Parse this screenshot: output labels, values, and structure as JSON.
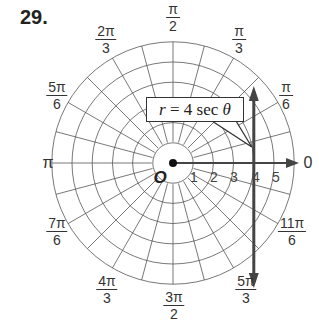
{
  "problem": {
    "number": "29."
  },
  "polar_grid": {
    "center": [
      173,
      163
    ],
    "unit_px": 20.2,
    "rings": [
      1,
      2,
      3,
      4,
      5,
      6
    ],
    "radial_step_degrees": 15,
    "grid_color": "#555555",
    "curve_color": "#444444"
  },
  "angle_labels": [
    {
      "id": "0",
      "text": "0"
    },
    {
      "id": "pi_6",
      "num": "π",
      "den": "6"
    },
    {
      "id": "pi_3",
      "num": "π",
      "den": "3"
    },
    {
      "id": "pi_2",
      "num": "π",
      "den": "2"
    },
    {
      "id": "2pi_3",
      "num": "2π",
      "den": "3"
    },
    {
      "id": "5pi_6",
      "num": "5π",
      "den": "6"
    },
    {
      "id": "pi",
      "text": "π"
    },
    {
      "id": "7pi_6",
      "num": "7π",
      "den": "6"
    },
    {
      "id": "4pi_3",
      "num": "4π",
      "den": "3"
    },
    {
      "id": "3pi_2",
      "num": "3π",
      "den": "2"
    },
    {
      "id": "5pi_3",
      "num": "5π",
      "den": "3"
    },
    {
      "id": "11pi_6",
      "num": "11π",
      "den": "6"
    }
  ],
  "axis": {
    "origin_label": "O",
    "tick_labels": [
      "1",
      "2",
      "3",
      "4",
      "5"
    ]
  },
  "callout": {
    "var": "r",
    "equals": " = 4 sec ",
    "theta": "θ"
  },
  "graph": {
    "equation": "r = 4 sec θ",
    "description": "vertical line x = 4"
  }
}
